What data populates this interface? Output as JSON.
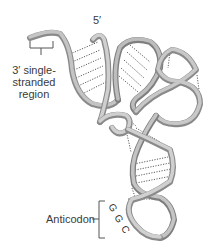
{
  "diagram": {
    "labels": {
      "three_prime_region_line1": "3′ single-",
      "three_prime_region_line2": "stranded",
      "three_prime_region_line3": "region",
      "five_prime": "5′",
      "anticodon": "Anticodon"
    },
    "anticodon_bases": [
      "G",
      "G",
      "C"
    ],
    "colors": {
      "ribbon": "#b5b5b5",
      "ribbon_shadow": "#7d7d7d",
      "ribbon_highlight": "#dcdcdc",
      "hydrogen_bonds": "#3a3a3a",
      "text": "#3a3a3a"
    }
  }
}
